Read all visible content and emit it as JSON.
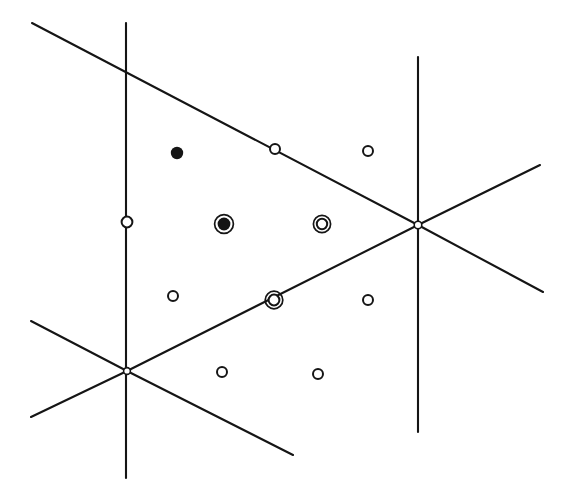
{
  "figure": {
    "type": "geometric-diagram",
    "width": 569,
    "height": 490,
    "background_color": "#ffffff",
    "line_color": "#151515",
    "marker_fill_color": "#151515",
    "marker_open_color": "#ffffff"
  },
  "chart_data": {
    "type": "scatter",
    "xlabel": "",
    "ylabel": "",
    "grid": false,
    "legend": "none",
    "xlim": [
      0,
      569
    ],
    "ylim": [
      0,
      490
    ],
    "lines": [
      {
        "name": "vertical-line-left",
        "orientation": "vertical",
        "x1": 126,
        "y1": 23,
        "x2": 126,
        "y2": 478
      },
      {
        "name": "vertical-line-right",
        "orientation": "vertical",
        "x1": 418,
        "y1": 57,
        "x2": 418,
        "y2": 432
      },
      {
        "name": "diagonal-descending-upper",
        "orientation": "descending",
        "x1": 32,
        "y1": 23,
        "x2": 418,
        "y2": 225
      },
      {
        "name": "diagonal-descending-lower-right",
        "orientation": "descending",
        "x1": 418,
        "y1": 225,
        "x2": 543,
        "y2": 292
      },
      {
        "name": "diagonal-ascending-through-nodes",
        "orientation": "ascending",
        "x1": 127,
        "y1": 371,
        "x2": 418,
        "y2": 225
      },
      {
        "name": "diagonal-ascending-right-tail",
        "orientation": "ascending",
        "x1": 418,
        "y1": 225,
        "x2": 540,
        "y2": 165
      },
      {
        "name": "diagonal-descending-into-node-a",
        "orientation": "descending",
        "x1": 31,
        "y1": 321,
        "x2": 127,
        "y2": 371
      },
      {
        "name": "diagonal-descending-out-of-node-a",
        "orientation": "descending",
        "x1": 127,
        "y1": 371,
        "x2": 293,
        "y2": 455
      },
      {
        "name": "diagonal-ascending-into-node-a",
        "orientation": "ascending",
        "x1": 31,
        "y1": 417,
        "x2": 127,
        "y2": 371
      }
    ],
    "nodes": [
      {
        "name": "node-left",
        "x": 127,
        "y": 371,
        "style": "tiny-open",
        "radius": 3.4
      },
      {
        "name": "node-right",
        "x": 418,
        "y": 225,
        "style": "tiny-open",
        "radius": 3.8
      }
    ],
    "points": [
      {
        "name": "point-filled-upper-left",
        "x": 177,
        "y": 153,
        "style": "filled",
        "radius": 6.2
      },
      {
        "name": "point-open-on-upper-diagonal",
        "x": 275,
        "y": 149,
        "style": "open",
        "radius": 5.0
      },
      {
        "name": "point-open-upper-right",
        "x": 368,
        "y": 151,
        "style": "open",
        "radius": 5.0
      },
      {
        "name": "point-open-on-left-vertical",
        "x": 127,
        "y": 222,
        "style": "open",
        "radius": 5.4
      },
      {
        "name": "point-filled-ringed-center",
        "x": 224,
        "y": 224,
        "style": "filled-ringed",
        "radius": 6.4,
        "ring_radius": 9.4
      },
      {
        "name": "point-double-ring-center-right",
        "x": 322,
        "y": 224,
        "style": "double-ring",
        "radius": 5.2,
        "ring_radius": 8.6
      },
      {
        "name": "point-open-mid-left",
        "x": 173,
        "y": 296,
        "style": "open",
        "radius": 5.0
      },
      {
        "name": "point-double-ring-on-ascending-diagonal",
        "x": 274,
        "y": 300,
        "style": "double-ring",
        "radius": 5.4,
        "ring_radius": 8.8
      },
      {
        "name": "point-open-mid-right",
        "x": 368,
        "y": 300,
        "style": "open",
        "radius": 5.0
      },
      {
        "name": "point-open-lower-left",
        "x": 222,
        "y": 372,
        "style": "open",
        "radius": 5.0
      },
      {
        "name": "point-open-lower-right",
        "x": 318,
        "y": 374,
        "style": "open",
        "radius": 5.0
      }
    ],
    "counts": {
      "lines": 9,
      "nodes": 2,
      "points": 11
    }
  }
}
